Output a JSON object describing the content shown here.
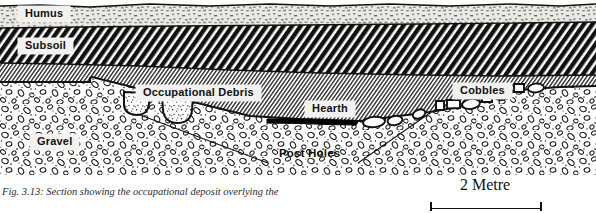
{
  "figure": {
    "caption": "Fig. 3.13: Section showing the occupational deposit overlying the",
    "labels": {
      "humus": "Humus",
      "subsoil": "Subsoil",
      "occupational_debris": "Occupational Debris",
      "hearth": "Hearth",
      "cobbles": "Cobbles",
      "gravel": "Gravel",
      "post_holes": "Post Holes"
    },
    "scale": {
      "text": "2 Metre",
      "length_m": 2
    },
    "colors": {
      "ink": "#111111",
      "humus_fill": "#c9c7c2",
      "subsoil_fill": "#1a1a1a",
      "debris_fill": "#cfcecb",
      "gravel_fill": "#fdfdfc",
      "hearth_fill": "#000000",
      "label_chip": "#f2f1ee"
    },
    "strata": [
      {
        "name": "Humus",
        "order": 1,
        "pattern": "stipple-speckle",
        "position": "topmost"
      },
      {
        "name": "Subsoil",
        "order": 2,
        "pattern": "coarse-diagonal-hatch-black",
        "position": "below humus"
      },
      {
        "name": "Occupational Debris",
        "order": 3,
        "pattern": "fine-diagonal-hatch-grey",
        "position": "below subsoil"
      },
      {
        "name": "Gravel",
        "order": 4,
        "pattern": "pebble-outline-stipple",
        "position": "basal"
      }
    ],
    "features": [
      {
        "name": "Hearth",
        "type": "black lens",
        "stratum": "base of Occupational Debris"
      },
      {
        "name": "Cobbles",
        "type": "stone setting",
        "stratum": "base of Occupational Debris, right side"
      },
      {
        "name": "Post Holes",
        "type": "cut features",
        "count": 2,
        "stratum": "cut into Gravel"
      }
    ]
  }
}
